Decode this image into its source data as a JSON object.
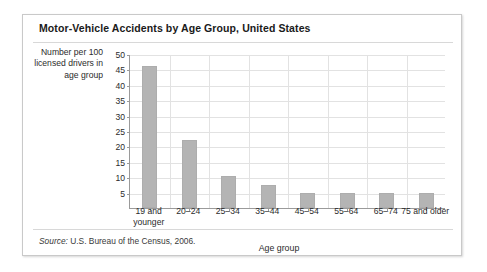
{
  "card": {
    "title": "Motor-Vehicle Accidents by Age Group, United States",
    "source_word": "Source:",
    "source_text": " U.S. Bureau of the Census, 2006."
  },
  "chart_data": {
    "type": "bar",
    "title": "Motor-Vehicle Accidents by Age Group, United States",
    "subtitle": "",
    "xlabel": "Age group",
    "ylabel": "Number per 100 licensed drivers in age group",
    "categories": [
      "19 and younger",
      "20–24",
      "25–34",
      "35–44",
      "45–54",
      "55–64",
      "65–74",
      "75 and older"
    ],
    "values": [
      46,
      22,
      10.5,
      7.5,
      4.8,
      4.8,
      4.8,
      4.8
    ],
    "ylim": [
      0,
      50
    ],
    "ytick_labels": [
      "5",
      "10",
      "15",
      "20",
      "25",
      "30",
      "35",
      "40",
      "45",
      "50"
    ],
    "ytick_values": [
      5,
      10,
      15,
      20,
      25,
      30,
      35,
      40,
      45,
      50
    ],
    "grid": "horizontal-and-vertical",
    "legend": "none",
    "bar_color": "#b4b4b4",
    "grid_color": "#e2e2e2",
    "axis_color": "#9a9a9a",
    "annotations": [
      "Source: U.S. Bureau of the Census, 2006."
    ]
  }
}
